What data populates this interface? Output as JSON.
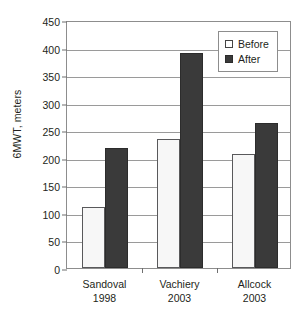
{
  "chart_data": {
    "type": "bar",
    "title": "",
    "subtitle": "",
    "xlabel": "",
    "ylabel": "6MWT, meters",
    "ylim": [
      0,
      450
    ],
    "ytick_step": 50,
    "yticks": [
      0,
      50,
      100,
      150,
      200,
      250,
      300,
      350,
      400,
      450
    ],
    "ytick_labels": [
      "0",
      "50",
      "100",
      "150",
      "200",
      "250",
      "300",
      "350",
      "400",
      "450"
    ],
    "grid": true,
    "grid_axis": "y",
    "legend_position": "top-right",
    "categories": [
      "Sandoval 1998",
      "Vachiery 2003",
      "Allcock 2003"
    ],
    "category_lines": [
      [
        "Sandoval",
        "1998"
      ],
      [
        "Vachiery",
        "2003"
      ],
      [
        "Allcock",
        "2003"
      ]
    ],
    "series": [
      {
        "name": "Before",
        "color": "#f7f7f7",
        "values": [
          110,
          235,
          207
        ]
      },
      {
        "name": "After",
        "color": "#3a3a3a",
        "values": [
          218,
          390,
          263
        ]
      }
    ],
    "annotations": []
  },
  "legend": {
    "items": [
      {
        "label": "Before",
        "swatch": "white-square-icon"
      },
      {
        "label": "After",
        "swatch": "filled-square-icon"
      }
    ]
  },
  "colors": {
    "before_fill": "#f7f7f7",
    "before_border": "#59595b",
    "after_fill": "#3a3a3a",
    "after_border": "#2c2c2c",
    "gridline": "#9a9a9a",
    "frame": "#8d8d8d",
    "text": "#231f20",
    "background": "#ffffff"
  }
}
